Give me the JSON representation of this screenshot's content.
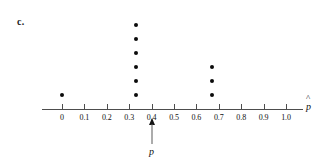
{
  "figure": {
    "panel_label": "c.",
    "axis_title_symbol": "p",
    "axis_title_accent": "^",
    "pointer_label": "p"
  },
  "chart_data": {
    "type": "scatter",
    "title": "",
    "subtitle": "",
    "xlabel": "p̂",
    "ylabel": "",
    "grid": false,
    "legend": "none",
    "xlim": [
      -0.05,
      1.05
    ],
    "xticks": [
      0,
      0.1,
      0.2,
      0.3,
      0.4,
      0.5,
      0.6,
      0.7,
      0.8,
      0.9,
      1.0
    ],
    "xtick_labels": [
      "0",
      "0.1",
      "0.2",
      "0.3",
      "0.4",
      "0.5",
      "0.6",
      "0.7",
      "0.8",
      "0.9",
      "1.0"
    ],
    "stacks": [
      {
        "x": 0.0,
        "count": 1
      },
      {
        "x": 0.33,
        "count": 6
      },
      {
        "x": 0.67,
        "count": 3
      }
    ],
    "values": [
      0.0,
      0.33,
      0.33,
      0.33,
      0.33,
      0.33,
      0.33,
      0.67,
      0.67,
      0.67
    ],
    "annotations": [
      {
        "label": "p",
        "x": 0.4,
        "type": "arrow-up",
        "note": "arrow marking true proportion p at 0.4"
      }
    ]
  }
}
